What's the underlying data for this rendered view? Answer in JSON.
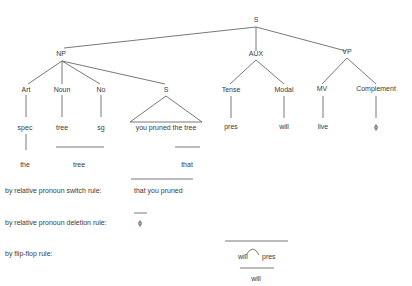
{
  "diagram": {
    "type": "syntax-tree",
    "header_fragment": "...",
    "root": {
      "label": "S"
    },
    "level1": {
      "np": "NP",
      "aux": "AUX",
      "vp": "VP"
    },
    "np_children": {
      "art": "Art",
      "noun": "Noun",
      "no": "No",
      "s": "S"
    },
    "aux_children": {
      "tense": "Tense",
      "modal": "Modal"
    },
    "vp_children": {
      "mv": "MV",
      "complement": "Complement"
    },
    "terminals": {
      "spec": "spec",
      "tree": "tree",
      "sg": "sg",
      "embedded_s": "you pruned the tree",
      "pres": "pres",
      "will": "will",
      "live": "live",
      "phi": "ϕ"
    },
    "derived": {
      "the": "the",
      "tree": "tree",
      "that": "that"
    },
    "rules": [
      {
        "label": "by relative pronoun switch rule:",
        "result": "that you pruned"
      },
      {
        "label": "by relative pronoun deletion rule:",
        "result": "ϕ"
      },
      {
        "label": "by flip-flop rule:",
        "result_a": "will",
        "result_b": "pres",
        "result_final": "will"
      }
    ]
  }
}
